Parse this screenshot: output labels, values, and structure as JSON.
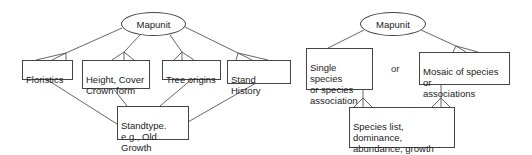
{
  "left_diagram": {
    "root": {
      "label": "Mapunit"
    },
    "attributes": [
      {
        "id": "floristics",
        "label": "Floristics"
      },
      {
        "id": "height-cover",
        "label": "Height, Cover\nCrown form"
      },
      {
        "id": "tree-origins",
        "label": "Tree origins"
      },
      {
        "id": "stand-history",
        "label": "Stand History"
      }
    ],
    "result": {
      "label": "Standtype.\ne.g., Old Growth"
    }
  },
  "right_diagram": {
    "root": {
      "label": "Mapunit"
    },
    "options": [
      {
        "id": "single-species",
        "label": "Single species\nor species\nassociation"
      },
      {
        "id": "mosaic",
        "label": "Mosaic of species or\nassociations"
      }
    ],
    "separator": "or",
    "result": {
      "label": "Species list, dominance,\nabundance, growth form,\nstratum"
    }
  },
  "colors": {
    "line": "#444444",
    "text": "#222222",
    "background": "#ffffff"
  }
}
